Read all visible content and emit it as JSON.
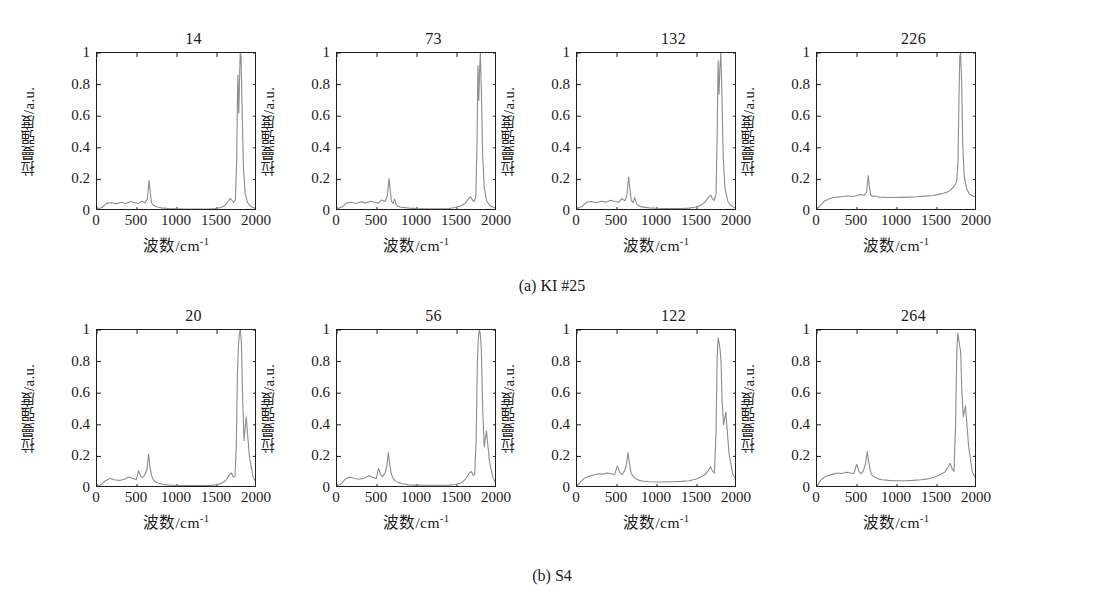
{
  "figure": {
    "axis_labels": {
      "x": "波数/cm",
      "x_superscript": "-1",
      "y": "拉曼强度/a.u."
    },
    "xticks": [
      "0",
      "500",
      "1000",
      "1500",
      "2000"
    ],
    "yticks": [
      "1",
      "0.8",
      "0.6",
      "0.4",
      "0.2",
      "0"
    ],
    "line_color": "#8c8c8c",
    "axis_color": "#1d1d1d",
    "rows": [
      {
        "caption": "(a) KI #25",
        "panels": [
          {
            "title": "14"
          },
          {
            "title": "73"
          },
          {
            "title": "132"
          },
          {
            "title": "226"
          }
        ]
      },
      {
        "caption": "(b) S4",
        "panels": [
          {
            "title": "20"
          },
          {
            "title": "56"
          },
          {
            "title": "122"
          },
          {
            "title": "264"
          }
        ]
      }
    ]
  },
  "chart_data": {
    "type": "line",
    "xlabel": "波数/cm-1",
    "ylabel": "拉曼强度/a.u.",
    "xlim": [
      0,
      2000
    ],
    "ylim": [
      0,
      1
    ],
    "xticks": [
      0,
      500,
      1000,
      1500,
      2000
    ],
    "yticks": [
      0,
      0.2,
      0.4,
      0.6,
      0.8,
      1
    ],
    "grid": false,
    "legend": null,
    "panels": [
      {
        "group": "(a) KI #25",
        "title": "14",
        "x": [
          0,
          60,
          120,
          180,
          240,
          300,
          360,
          420,
          480,
          520,
          560,
          600,
          630,
          650,
          665,
          680,
          700,
          730,
          760,
          800,
          900,
          1000,
          1100,
          1200,
          1300,
          1400,
          1480,
          1550,
          1600,
          1640,
          1665,
          1690,
          1710,
          1730,
          1745,
          1760,
          1772,
          1780,
          1790,
          1800,
          1815,
          1830,
          1850,
          1880,
          1920,
          1960,
          2000
        ],
        "y": [
          0.012,
          0.022,
          0.048,
          0.052,
          0.045,
          0.055,
          0.048,
          0.06,
          0.052,
          0.048,
          0.062,
          0.052,
          0.075,
          0.195,
          0.12,
          0.055,
          0.038,
          0.03,
          0.025,
          0.02,
          0.016,
          0.014,
          0.013,
          0.013,
          0.012,
          0.013,
          0.016,
          0.022,
          0.035,
          0.062,
          0.08,
          0.065,
          0.055,
          0.075,
          0.3,
          0.86,
          0.62,
          0.8,
          1.0,
          0.98,
          0.62,
          0.28,
          0.12,
          0.055,
          0.03,
          0.02,
          0.016
        ]
      },
      {
        "group": "(a) KI #25",
        "title": "73",
        "x": [
          0,
          60,
          120,
          180,
          240,
          300,
          360,
          420,
          470,
          520,
          560,
          600,
          630,
          650,
          665,
          680,
          700,
          720,
          740,
          760,
          800,
          900,
          1000,
          1100,
          1200,
          1300,
          1400,
          1470,
          1540,
          1600,
          1640,
          1670,
          1695,
          1715,
          1735,
          1750,
          1762,
          1772,
          1782,
          1792,
          1805,
          1820,
          1840,
          1870,
          1910,
          1955,
          2000
        ],
        "y": [
          0.012,
          0.025,
          0.05,
          0.055,
          0.048,
          0.058,
          0.05,
          0.062,
          0.055,
          0.05,
          0.07,
          0.06,
          0.095,
          0.205,
          0.135,
          0.062,
          0.048,
          0.075,
          0.04,
          0.03,
          0.024,
          0.018,
          0.015,
          0.014,
          0.014,
          0.014,
          0.016,
          0.022,
          0.03,
          0.048,
          0.075,
          0.09,
          0.068,
          0.06,
          0.09,
          0.42,
          0.92,
          0.7,
          0.88,
          1.0,
          0.75,
          0.36,
          0.15,
          0.065,
          0.035,
          0.022,
          0.017
        ]
      },
      {
        "group": "(a) KI #25",
        "title": "132",
        "x": [
          0,
          60,
          120,
          180,
          240,
          300,
          360,
          420,
          470,
          520,
          560,
          600,
          625,
          645,
          660,
          678,
          700,
          720,
          745,
          770,
          810,
          900,
          1000,
          1100,
          1200,
          1300,
          1400,
          1470,
          1540,
          1600,
          1640,
          1672,
          1695,
          1715,
          1738,
          1752,
          1764,
          1775,
          1786,
          1798,
          1812,
          1828,
          1850,
          1885,
          1925,
          1965,
          2000
        ],
        "y": [
          0.013,
          0.028,
          0.055,
          0.06,
          0.052,
          0.062,
          0.056,
          0.068,
          0.06,
          0.055,
          0.078,
          0.065,
          0.105,
          0.215,
          0.145,
          0.07,
          0.052,
          0.085,
          0.045,
          0.034,
          0.026,
          0.02,
          0.017,
          0.016,
          0.016,
          0.016,
          0.018,
          0.024,
          0.034,
          0.055,
          0.085,
          0.1,
          0.075,
          0.068,
          0.105,
          0.48,
          0.95,
          0.74,
          0.9,
          1.0,
          0.72,
          0.34,
          0.14,
          0.062,
          0.034,
          0.022,
          0.018
        ]
      },
      {
        "group": "(a) KI #25",
        "title": "226",
        "x": [
          0,
          40,
          90,
          140,
          200,
          260,
          320,
          380,
          440,
          500,
          545,
          590,
          620,
          640,
          655,
          672,
          695,
          720,
          750,
          790,
          850,
          950,
          1050,
          1150,
          1250,
          1350,
          1450,
          1520,
          1580,
          1630,
          1670,
          1700,
          1725,
          1745,
          1762,
          1775,
          1785,
          1795,
          1808,
          1822,
          1840,
          1870,
          1910,
          1950,
          2000
        ],
        "y": [
          0.01,
          0.035,
          0.062,
          0.075,
          0.085,
          0.088,
          0.092,
          0.095,
          0.092,
          0.098,
          0.105,
          0.098,
          0.12,
          0.225,
          0.155,
          0.1,
          0.092,
          0.095,
          0.09,
          0.088,
          0.086,
          0.085,
          0.086,
          0.088,
          0.09,
          0.094,
          0.098,
          0.105,
          0.112,
          0.12,
          0.132,
          0.15,
          0.165,
          0.185,
          0.3,
          0.72,
          0.98,
          1.0,
          0.82,
          0.42,
          0.22,
          0.14,
          0.105,
          0.095,
          0.09
        ]
      },
      {
        "group": "(b) S4",
        "title": "20",
        "x": [
          0,
          50,
          100,
          160,
          220,
          280,
          340,
          400,
          450,
          490,
          520,
          545,
          570,
          600,
          625,
          645,
          660,
          680,
          700,
          730,
          770,
          820,
          900,
          1000,
          1100,
          1200,
          1300,
          1400,
          1480,
          1550,
          1610,
          1650,
          1680,
          1705,
          1725,
          1742,
          1755,
          1768,
          1780,
          1792,
          1805,
          1820,
          1838,
          1865,
          1905,
          1950,
          2000
        ],
        "y": [
          0.01,
          0.02,
          0.045,
          0.06,
          0.052,
          0.048,
          0.055,
          0.07,
          0.06,
          0.052,
          0.11,
          0.075,
          0.065,
          0.085,
          0.12,
          0.215,
          0.14,
          0.085,
          0.055,
          0.04,
          0.03,
          0.024,
          0.018,
          0.016,
          0.015,
          0.015,
          0.015,
          0.016,
          0.02,
          0.028,
          0.048,
          0.08,
          0.095,
          0.07,
          0.075,
          0.28,
          0.72,
          0.9,
          0.98,
          1.0,
          0.92,
          0.58,
          0.3,
          0.45,
          0.2,
          0.07,
          0.025
        ]
      },
      {
        "group": "(b) S4",
        "title": "56",
        "x": [
          0,
          50,
          100,
          160,
          220,
          280,
          340,
          400,
          450,
          490,
          520,
          545,
          570,
          600,
          622,
          642,
          658,
          678,
          700,
          730,
          770,
          820,
          900,
          1000,
          1100,
          1200,
          1300,
          1400,
          1480,
          1550,
          1605,
          1648,
          1678,
          1702,
          1722,
          1740,
          1754,
          1766,
          1778,
          1790,
          1804,
          1820,
          1840,
          1868,
          1908,
          1952,
          2000
        ],
        "y": [
          0.012,
          0.025,
          0.055,
          0.07,
          0.06,
          0.055,
          0.062,
          0.078,
          0.068,
          0.058,
          0.125,
          0.085,
          0.072,
          0.095,
          0.135,
          0.225,
          0.15,
          0.092,
          0.062,
          0.045,
          0.034,
          0.027,
          0.02,
          0.018,
          0.017,
          0.017,
          0.017,
          0.018,
          0.022,
          0.032,
          0.055,
          0.09,
          0.105,
          0.08,
          0.085,
          0.32,
          0.78,
          0.94,
          1.0,
          0.98,
          0.88,
          0.52,
          0.26,
          0.36,
          0.16,
          0.06,
          0.022
        ]
      },
      {
        "group": "(b) S4",
        "title": "122",
        "x": [
          0,
          45,
          95,
          150,
          210,
          265,
          320,
          375,
          430,
          470,
          505,
          535,
          562,
          590,
          615,
          638,
          655,
          675,
          698,
          730,
          770,
          820,
          900,
          1000,
          1100,
          1200,
          1300,
          1400,
          1480,
          1545,
          1600,
          1640,
          1670,
          1695,
          1718,
          1738,
          1752,
          1764,
          1776,
          1788,
          1800,
          1814,
          1832,
          1860,
          1900,
          1945,
          2000
        ],
        "y": [
          0.01,
          0.04,
          0.062,
          0.075,
          0.082,
          0.09,
          0.088,
          0.095,
          0.09,
          0.085,
          0.14,
          0.1,
          0.085,
          0.105,
          0.14,
          0.225,
          0.155,
          0.1,
          0.075,
          0.06,
          0.05,
          0.044,
          0.04,
          0.038,
          0.038,
          0.04,
          0.042,
          0.046,
          0.055,
          0.068,
          0.085,
          0.11,
          0.135,
          0.105,
          0.095,
          0.35,
          0.82,
          0.95,
          0.92,
          0.88,
          0.8,
          0.55,
          0.4,
          0.48,
          0.22,
          0.09,
          0.04
        ]
      },
      {
        "group": "(b) S4",
        "title": "264",
        "x": [
          0,
          40,
          90,
          145,
          200,
          255,
          310,
          365,
          420,
          460,
          495,
          525,
          552,
          580,
          605,
          628,
          648,
          668,
          690,
          725,
          765,
          815,
          895,
          995,
          1095,
          1195,
          1295,
          1395,
          1475,
          1540,
          1595,
          1635,
          1665,
          1690,
          1712,
          1732,
          1748,
          1760,
          1772,
          1784,
          1796,
          1810,
          1828,
          1856,
          1896,
          1942,
          2000
        ],
        "y": [
          0.012,
          0.045,
          0.068,
          0.08,
          0.088,
          0.095,
          0.092,
          0.1,
          0.095,
          0.09,
          0.15,
          0.105,
          0.09,
          0.11,
          0.15,
          0.23,
          0.16,
          0.105,
          0.08,
          0.068,
          0.058,
          0.052,
          0.048,
          0.046,
          0.046,
          0.048,
          0.052,
          0.058,
          0.07,
          0.085,
          0.1,
          0.13,
          0.155,
          0.12,
          0.105,
          0.4,
          0.88,
          0.98,
          0.94,
          0.9,
          0.86,
          0.62,
          0.45,
          0.52,
          0.26,
          0.1,
          0.045
        ]
      }
    ]
  }
}
